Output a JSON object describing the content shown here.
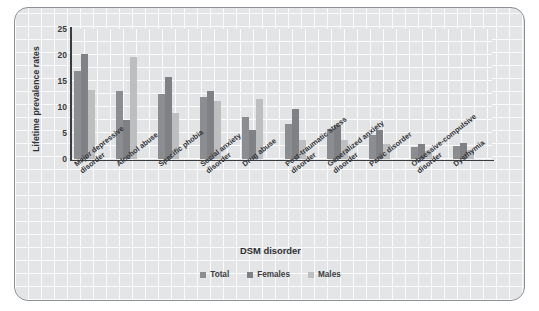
{
  "chart_data": {
    "type": "bar",
    "title": "",
    "xlabel": "DSM disorder",
    "ylabel": "Lifetime prevalence rates",
    "ylim": [
      0,
      25
    ],
    "yticks": [
      0,
      5,
      10,
      15,
      20,
      25
    ],
    "grid": true,
    "legend_position": "bottom",
    "categories": [
      "Major depressive\ndisorder",
      "Alcohol abuse",
      "Specific phobia",
      "Social anxiety\ndisorder",
      "Drug abuse",
      "Post-traumatic stress\ndisorder",
      "Generalized anxiety\ndisorder",
      "Panic disorder",
      "Obsessive-compulsive\ndisorder",
      "Dysthymia"
    ],
    "series": [
      {
        "name": "Total",
        "color": "#8b8d90",
        "values": [
          16.9,
          13.1,
          12.5,
          12.0,
          8.0,
          6.8,
          5.7,
          4.7,
          2.3,
          2.5
        ]
      },
      {
        "name": "Females",
        "color": "#7f8184",
        "values": [
          20.2,
          7.5,
          15.7,
          13.0,
          5.5,
          9.7,
          6.6,
          5.6,
          2.8,
          3.0
        ]
      },
      {
        "name": "Males",
        "color": "#bcbec0",
        "values": [
          13.2,
          19.6,
          8.8,
          11.1,
          11.6,
          3.6,
          3.6,
          2.8,
          1.6,
          1.8
        ]
      }
    ]
  },
  "legend": {
    "items": [
      {
        "label": "Total"
      },
      {
        "label": "Females"
      },
      {
        "label": "Males"
      }
    ]
  }
}
